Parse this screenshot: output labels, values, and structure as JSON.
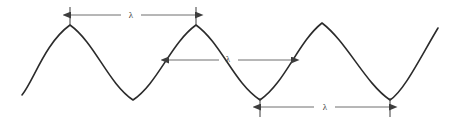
{
  "figure": {
    "background_color": "#ffffff",
    "wave_color": "#2b2b2b",
    "annotation_color": "#4d4d4d",
    "width": 459,
    "height": 122
  },
  "wave": {
    "description": "Continuous sine wave with three full visible crests",
    "stroke_width": 1.6,
    "centerline_y": 62,
    "amplitude": 37,
    "period": 126,
    "start_point": [
      22,
      95
    ],
    "end_point": [
      438,
      28
    ],
    "crests_x": [
      70,
      196,
      322
    ],
    "troughs_x": [
      133,
      260,
      390
    ],
    "path": "M 22 95 C 34 80 45 43 70 25 C 95 43 108 83 133 100 C 158 83 171 43 196 25 C 221 43 234 83 260 100 C 285 83 298 42 322 23 C 347 42 365 83 390 100 C 404 91 420 58 438 28"
  },
  "annotations": [
    {
      "id": "wavelength-crest-to-crest",
      "label": "λ",
      "y": 15,
      "x_start": 70,
      "x_end": 196,
      "label_x": 131,
      "label_y": 18,
      "tick_top": 7,
      "tick_bottom": 25,
      "ticks": true
    },
    {
      "id": "wavelength-midline",
      "label": "λ",
      "y": 60,
      "x_start": 168,
      "x_end": 292,
      "label_x": 228,
      "label_y": 62,
      "tick_top": 60,
      "tick_bottom": 60,
      "ticks": false
    },
    {
      "id": "wavelength-trough-to-trough",
      "label": "λ",
      "y": 107,
      "x_start": 260,
      "x_end": 390,
      "label_x": 325,
      "label_y": 110,
      "tick_top": 98,
      "tick_bottom": 117,
      "ticks": true
    }
  ]
}
